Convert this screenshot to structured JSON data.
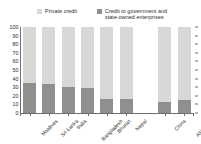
{
  "chart_data": {
    "type": "bar",
    "subtype": "stacked-bar-100",
    "title": "",
    "xlabel": "",
    "ylabel": "",
    "ylim": [
      0,
      100
    ],
    "yticks": [
      0,
      10,
      20,
      30,
      40,
      50,
      60,
      70,
      80,
      90,
      100
    ],
    "grid": false,
    "legend_position": "top",
    "categories": [
      "Maldives",
      "Sri Lanka",
      "India",
      "Bangladesh",
      "Bhutan",
      "Nepal",
      "China",
      "ASEAN-4"
    ],
    "series": [
      {
        "name": "Private credit",
        "color": "#d8d8d6",
        "values": [
          65,
          66,
          70,
          71,
          84,
          84,
          87,
          85
        ]
      },
      {
        "name": "Credit to government and state-owned enterprises",
        "color": "#8f8f8d",
        "values": [
          35,
          34,
          30,
          29,
          16,
          16,
          13,
          15
        ]
      }
    ],
    "group_gap_after_index": 5
  },
  "legend": {
    "items": [
      {
        "label": "Private credit",
        "color": "#d8d8d6",
        "swatch": "legend-swatch-private-credit"
      },
      {
        "label": "Credit to government and\nstate-owned enterprises",
        "color": "#8f8f8d",
        "swatch": "legend-swatch-gov-credit"
      }
    ]
  },
  "axis": {
    "y_labels": [
      "100",
      "90",
      "80",
      "70",
      "60",
      "50",
      "40",
      "30",
      "20",
      "10",
      "0"
    ],
    "x_labels": [
      "Maldives",
      "Sri Lanka",
      "India",
      "Bangladesh",
      "Bhutan",
      "Nepal",
      "China",
      "ASEAN-4"
    ]
  },
  "colors": {
    "private_credit": "#d8d8d6",
    "gov_credit": "#8f8f8d",
    "axis": "#6e6e6e",
    "text": "#2b2b2b",
    "background": "#ffffff"
  }
}
